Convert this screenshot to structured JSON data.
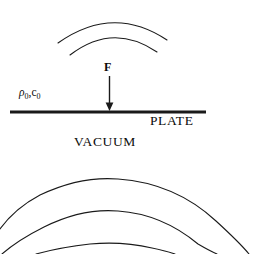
{
  "figure": {
    "background_color": "#ffffff",
    "line_color": "#1a1a1a",
    "width": 255,
    "height": 254
  },
  "labels": {
    "plate": "PLATE",
    "vacuum": "VACUUM",
    "force": "F",
    "medium_density": "ρ",
    "medium_density_sub": "0",
    "medium_separator": ",",
    "medium_speed": "c",
    "medium_speed_sub": "0"
  },
  "plate": {
    "x1": 10,
    "x2": 206,
    "y": 112,
    "thickness": 3.2
  },
  "force_arrow": {
    "x": 109.5,
    "y_start": 76,
    "y_end": 110,
    "head_width": 8,
    "head_length": 7,
    "shaft_width": 1.4
  },
  "wavefronts_upper": {
    "description": "two concentric arcs above plate",
    "count": 2,
    "stroke_width": 1.1,
    "arcs": [
      {
        "d": "M 58 43 Q 113 4 167 40",
        "radius_hint": 95
      },
      {
        "d": "M 70 55 Q 113 22 157 52",
        "radius_hint": 72
      }
    ]
  },
  "wavefronts_lower": {
    "description": "three concentric arcs below vacuum region",
    "count": 3,
    "stroke_width": 1.1,
    "arcs": [
      {
        "d": "M -14 254 Q 2 215 40 195 Q 80 176 118 179 Q 175 183 216 221 Q 240 243 249 254",
        "radius_hint": 160
      },
      {
        "d": "M 2 254 Q 18 240 44 227 Q 82 208 118 211 Q 162 214 198 244 Q 210 251 217 254",
        "radius_hint": 120
      },
      {
        "d": "M 36 254 Q 62 247 90 244 Q 122 241 152 248 Q 166 251 175 254",
        "radius_hint": 82
      }
    ]
  }
}
